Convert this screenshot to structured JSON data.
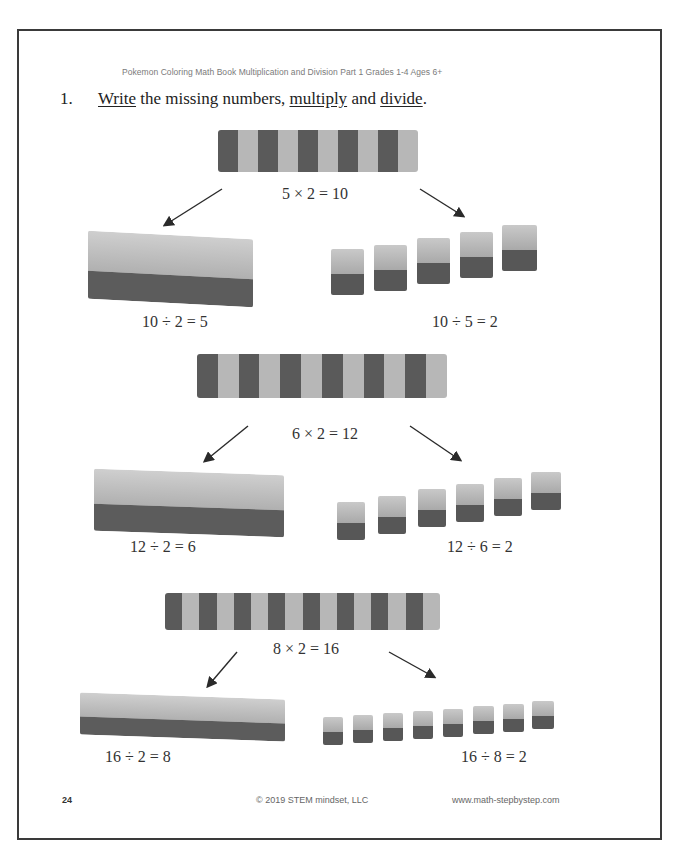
{
  "page": {
    "header": "Pokemon Coloring Math Book Multiplication and Division Part 1 Grades 1-4 Ages 6+",
    "question": {
      "number": "1.",
      "parts": [
        "Write",
        " the missing numbers, ",
        "multiply",
        " and ",
        "divide",
        "."
      ]
    },
    "footer": {
      "page_number": "24",
      "copyright": "© 2019 STEM mindset, LLC",
      "website": "www.math-stepbystep.com"
    }
  },
  "problems": [
    {
      "multiplication": "5 × 2 = 10",
      "division_left": "10 ÷ 2 = 5",
      "division_right": "10 ÷ 5 = 2",
      "stripes": 10,
      "cubes": 5
    },
    {
      "multiplication": "6 × 2 = 12",
      "division_left": "12 ÷ 2 = 6",
      "division_right": "12 ÷ 6 = 2",
      "stripes": 12,
      "cubes": 6
    },
    {
      "multiplication": "8 × 2 = 16",
      "division_left": "16 ÷ 2 = 8",
      "division_right": "16 ÷ 8 = 2",
      "stripes": 16,
      "cubes": 8
    }
  ],
  "colors": {
    "border": "#3a3a3a",
    "brick_dark": "#5a5a5a",
    "brick_light": "#b7b7b7"
  }
}
